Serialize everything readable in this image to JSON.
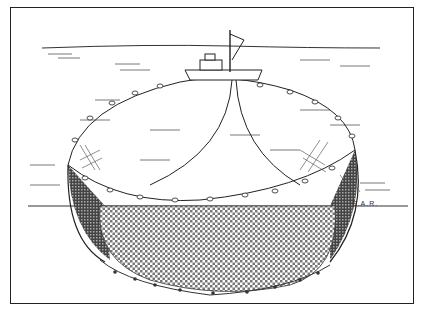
{
  "figure": {
    "signature": "S.A.R.",
    "elements": {
      "boat": "fishing vessel with mast at top center",
      "float_line": "elliptical cork line at surface",
      "net_wall": "mesh net hanging below waterline",
      "purse_line": "bottom lead line with rings, pursed",
      "horizon": "distant shoreline"
    },
    "colors": {
      "ink": "#222222",
      "paper": "#ffffff",
      "mesh_dark": "#555555"
    }
  }
}
